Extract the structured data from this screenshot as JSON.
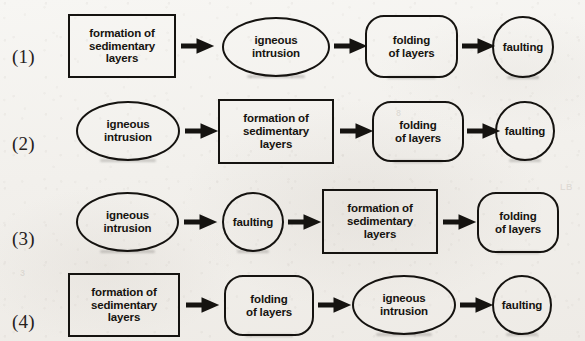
{
  "page": {
    "kind": "multiple-choice-options-diagram",
    "width": 585,
    "height": 341,
    "ink_color": "#151310",
    "paper_color": "#f2f0ec"
  },
  "arrow": {
    "glyph": "→",
    "name": "right-arrow-icon"
  },
  "labels": {
    "formation": "formation of\nsedimentary\nlayers",
    "igneous": "igneous\nintrusion",
    "folding": "folding\nof layers",
    "faulting": "faulting"
  },
  "bleed_through": [
    {
      "text": "8",
      "x": 396,
      "y": 108
    },
    {
      "text": "LB",
      "x": 560,
      "y": 182
    },
    {
      "text": "3",
      "x": 20,
      "y": 268
    }
  ],
  "options": [
    {
      "id": "option-1",
      "label": "(1)",
      "label_x": 12,
      "label_y": 46,
      "row_top": 0,
      "steps": [
        {
          "text": "formation of\nsedimentary\nlayers",
          "shape": "rect",
          "name": "formation-of-sedimentary-layers",
          "x": 68,
          "y": 14,
          "w": 108,
          "h": 64
        },
        {
          "text": "igneous\nintrusion",
          "shape": "ellipse",
          "name": "igneous-intrusion",
          "x": 222,
          "y": 17,
          "w": 108,
          "h": 60
        },
        {
          "text": "folding\nof layers",
          "shape": "roundrect",
          "name": "folding-of-layers",
          "x": 365,
          "y": 15,
          "w": 93,
          "h": 63
        },
        {
          "text": "faulting",
          "shape": "circle",
          "name": "faulting",
          "x": 492,
          "y": 16,
          "w": 62,
          "h": 62
        }
      ],
      "arrows": [
        {
          "x": 181,
          "y": 36
        },
        {
          "x": 334,
          "y": 36
        },
        {
          "x": 462,
          "y": 36
        }
      ]
    },
    {
      "id": "option-2",
      "label": "(2)",
      "label_x": 12,
      "label_y": 133,
      "row_top": 0,
      "steps": [
        {
          "text": "igneous\nintrusion",
          "shape": "ellipse",
          "name": "igneous-intrusion",
          "x": 76,
          "y": 101,
          "w": 104,
          "h": 60
        },
        {
          "text": "formation of\nsedimentary\nlayers",
          "shape": "rect",
          "name": "formation-of-sedimentary-layers",
          "x": 218,
          "y": 99,
          "w": 116,
          "h": 65
        },
        {
          "text": "folding\nof layers",
          "shape": "roundrect",
          "name": "folding-of-layers",
          "x": 372,
          "y": 101,
          "w": 92,
          "h": 61
        },
        {
          "text": "faulting",
          "shape": "circle",
          "name": "faulting",
          "x": 495,
          "y": 101,
          "w": 60,
          "h": 60
        }
      ],
      "arrows": [
        {
          "x": 185,
          "y": 121
        },
        {
          "x": 340,
          "y": 121
        },
        {
          "x": 467,
          "y": 121
        }
      ]
    },
    {
      "id": "option-3",
      "label": "(3)",
      "label_x": 12,
      "label_y": 228,
      "row_top": 0,
      "steps": [
        {
          "text": "igneous\nintrusion",
          "shape": "ellipse",
          "name": "igneous-intrusion",
          "x": 76,
          "y": 192,
          "w": 103,
          "h": 60
        },
        {
          "text": "faulting",
          "shape": "circle",
          "name": "faulting",
          "x": 222,
          "y": 192,
          "w": 62,
          "h": 60
        },
        {
          "text": "formation of\nsedimentary\nlayers",
          "shape": "rect",
          "name": "formation-of-sedimentary-layers",
          "x": 322,
          "y": 189,
          "w": 116,
          "h": 65
        },
        {
          "text": "folding\nof layers",
          "shape": "roundrect",
          "name": "folding-of-layers",
          "x": 477,
          "y": 192,
          "w": 82,
          "h": 61
        }
      ],
      "arrows": [
        {
          "x": 184,
          "y": 212
        },
        {
          "x": 288,
          "y": 212
        },
        {
          "x": 443,
          "y": 212
        }
      ]
    },
    {
      "id": "option-4",
      "label": "(4)",
      "label_x": 12,
      "label_y": 311,
      "row_top": 0,
      "steps": [
        {
          "text": "formation of\nsedimentary\nlayers",
          "shape": "rect",
          "name": "formation-of-sedimentary-layers",
          "x": 68,
          "y": 273,
          "w": 112,
          "h": 64
        },
        {
          "text": "folding\nof layers",
          "shape": "roundrect",
          "name": "folding-of-layers",
          "x": 224,
          "y": 275,
          "w": 90,
          "h": 61
        },
        {
          "text": "igneous\nintrusion",
          "shape": "ellipse",
          "name": "igneous-intrusion",
          "x": 352,
          "y": 275,
          "w": 104,
          "h": 60
        },
        {
          "text": "faulting",
          "shape": "circle",
          "name": "faulting",
          "x": 492,
          "y": 275,
          "w": 60,
          "h": 60
        }
      ],
      "arrows": [
        {
          "x": 186,
          "y": 295
        },
        {
          "x": 318,
          "y": 295
        },
        {
          "x": 460,
          "y": 295
        }
      ]
    }
  ]
}
